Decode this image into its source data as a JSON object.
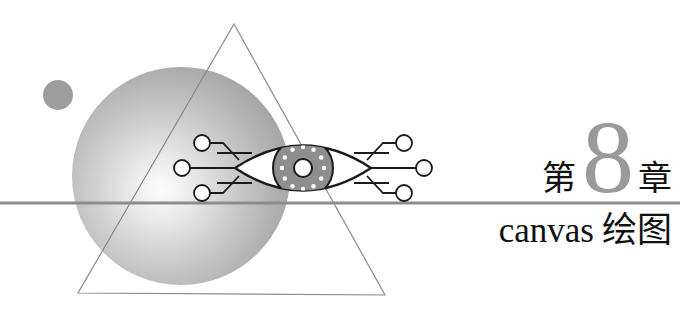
{
  "page": {
    "width": 680,
    "height": 310,
    "background": "#ffffff"
  },
  "heading": {
    "chapter_prefix": "第",
    "chapter_number": "8",
    "chapter_suffix": "章",
    "title_latin": "canvas",
    "title_cjk": "绘图",
    "number_color": "#9a9a9a",
    "text_color": "#111111"
  },
  "divider": {
    "name": "horizontal-rule",
    "y": 203,
    "color": "#8c8c8c",
    "thickness": 3
  },
  "artwork": {
    "sphere": {
      "name": "gradient-sphere",
      "cx": 181,
      "cy": 176,
      "r": 109,
      "highlight_x": 160,
      "highlight_y": 188,
      "color_light": "#fdfdfd",
      "color_mid": "#b6b6b6",
      "color_dark": "#8f8f8f"
    },
    "small_circle": {
      "name": "small-gray-circle",
      "cx": 58,
      "cy": 95,
      "r": 15,
      "color": "#9d9d9d"
    },
    "triangle": {
      "name": "triangle-outline",
      "points": "234,24 385,295 78,293",
      "stroke": "#8a8a8a",
      "stroke_width": 1.2
    },
    "eye": {
      "name": "circuit-eye",
      "cx": 303,
      "cy": 168,
      "half_width": 68,
      "half_height": 33,
      "iris_r": 30,
      "pupil_r": 9,
      "pupil_inner_r": 5,
      "dot_count": 12,
      "dot_r": 2.2,
      "outline": "#1a1a1a",
      "iris_fill": "#8e8e8e",
      "sclera_fill": "#ffffff",
      "dot_fill": "#ffffff"
    },
    "traces": {
      "name": "circuit-traces",
      "stroke": "#1a1a1a",
      "stroke_width": 1.8,
      "node_r": 8,
      "node_fill": "#ffffff"
    }
  }
}
